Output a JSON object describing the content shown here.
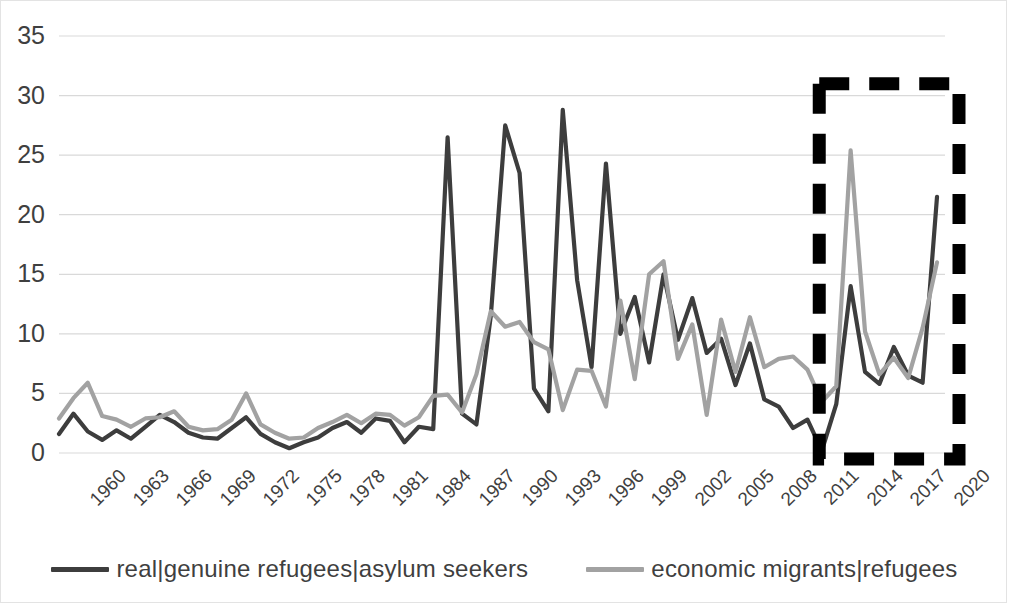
{
  "chart_data": {
    "type": "line",
    "title": "",
    "xlabel": "",
    "ylabel": "",
    "ylim": [
      0,
      35
    ],
    "ytick_values": [
      0,
      5,
      10,
      15,
      20,
      25,
      30,
      35
    ],
    "ytick_labels": [
      "0",
      "5",
      "10",
      "15",
      "20",
      "25",
      "30",
      "35"
    ],
    "grid": "horizontal",
    "legend_position": "bottom",
    "x": [
      1960,
      1961,
      1962,
      1963,
      1964,
      1965,
      1966,
      1967,
      1968,
      1969,
      1970,
      1971,
      1972,
      1973,
      1974,
      1975,
      1976,
      1977,
      1978,
      1979,
      1980,
      1981,
      1982,
      1983,
      1984,
      1985,
      1986,
      1987,
      1988,
      1989,
      1990,
      1991,
      1992,
      1993,
      1994,
      1995,
      1996,
      1997,
      1998,
      1999,
      2000,
      2001,
      2002,
      2003,
      2004,
      2005,
      2006,
      2007,
      2008,
      2009,
      2010,
      2011,
      2012,
      2013,
      2014,
      2015,
      2016,
      2017,
      2018,
      2019,
      2020,
      2021
    ],
    "xtick_labels": [
      "1960",
      "1963",
      "1966",
      "1969",
      "1972",
      "1975",
      "1978",
      "1981",
      "1984",
      "1987",
      "1990",
      "1993",
      "1996",
      "1999",
      "2002",
      "2005",
      "2008",
      "2011",
      "2014",
      "2017",
      "2020"
    ],
    "xtick_step": 3,
    "series": [
      {
        "name": "real|genuine refugees|asylum seekers",
        "color": "#3d3d3d",
        "values": [
          1.6,
          3.3,
          1.8,
          1.1,
          1.9,
          1.2,
          2.2,
          3.2,
          2.6,
          1.7,
          1.3,
          1.2,
          2.1,
          3.0,
          1.6,
          0.9,
          0.4,
          0.9,
          1.3,
          2.1,
          2.6,
          1.7,
          2.9,
          2.7,
          0.9,
          2.2,
          2.0,
          26.5,
          3.3,
          2.4,
          11.5,
          27.5,
          23.5,
          5.4,
          3.5,
          28.8,
          14.5,
          7.2,
          24.3,
          10.0,
          13.1,
          7.6,
          15.0,
          9.5,
          13.0,
          8.4,
          9.6,
          5.7,
          9.2,
          4.5,
          3.9,
          2.1,
          2.8,
          0.2,
          4.1,
          14.0,
          6.8,
          5.8,
          8.9,
          6.5,
          5.9,
          21.5
        ]
      },
      {
        "name": "economic migrants|refugees",
        "color": "#a2a2a2",
        "values": [
          2.9,
          4.6,
          5.9,
          3.1,
          2.8,
          2.2,
          2.9,
          3.0,
          3.5,
          2.2,
          1.9,
          2.0,
          2.8,
          5.0,
          2.4,
          1.7,
          1.2,
          1.3,
          2.1,
          2.6,
          3.2,
          2.5,
          3.3,
          3.2,
          2.3,
          3.0,
          4.8,
          4.9,
          3.4,
          6.6,
          11.9,
          10.6,
          11.0,
          9.3,
          8.7,
          3.6,
          7.0,
          6.9,
          3.9,
          12.8,
          6.2,
          15.0,
          16.1,
          7.9,
          10.8,
          3.2,
          11.2,
          6.8,
          11.4,
          7.2,
          7.9,
          8.1,
          7.0,
          4.3,
          5.6,
          25.4,
          10.2,
          6.6,
          8.0,
          6.3,
          10.5,
          16.0
        ]
      }
    ],
    "annotations": [
      {
        "type": "dashed-rectangle",
        "name": "highlight-box",
        "color": "#000000",
        "x_start": 2014,
        "x_end": 2021,
        "y_start": 0,
        "y_end": 31
      }
    ]
  },
  "legend": {
    "items": [
      {
        "label": "real|genuine refugees|asylum seekers",
        "color": "#3d3d3d"
      },
      {
        "label": "economic migrants|refugees",
        "color": "#a2a2a2"
      }
    ]
  }
}
